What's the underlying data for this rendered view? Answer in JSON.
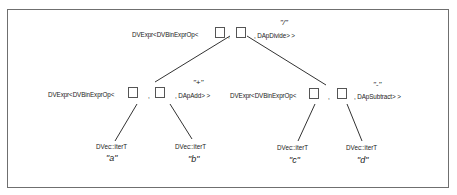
{
  "diagram": {
    "root": {
      "prefix": "DVExpr<DVBinExprOp<",
      "sep": ",",
      "suffix": ", DApDivide> >",
      "op_label": "\"/\""
    },
    "left": {
      "prefix": "DVExpr<DVBinExprOp<",
      "sep": ",",
      "suffix": ", DApAdd> >",
      "op_label": "\"+\""
    },
    "right": {
      "prefix": "DVExpr<DVBinExprOp<",
      "sep": ",",
      "suffix": ", DApSubtract> >",
      "op_label": "\"-\""
    },
    "leaves": [
      {
        "type": "DVec::iterT",
        "symbol": "\"a\""
      },
      {
        "type": "DVec::iterT",
        "symbol": "\"b\""
      },
      {
        "type": "DVec::iterT",
        "symbol": "\"c\""
      },
      {
        "type": "DVec::iterT",
        "symbol": "\"d\""
      }
    ]
  }
}
